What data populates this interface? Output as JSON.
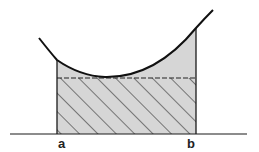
{
  "diagram": {
    "type": "integral-mean-value-illustration",
    "labels": {
      "left_bound": "a",
      "right_bound": "b"
    },
    "colors": {
      "stroke": "#1a1a1a",
      "fill_region": "#d4d4d4",
      "hatch": "#222222",
      "background": "#ffffff"
    },
    "elements": [
      "convex curve f(x)",
      "shaded area under curve from a to b",
      "hatched rectangle of height equal to minimum (mean) value",
      "dashed horizontal line at rectangle top",
      "x-axis"
    ]
  }
}
